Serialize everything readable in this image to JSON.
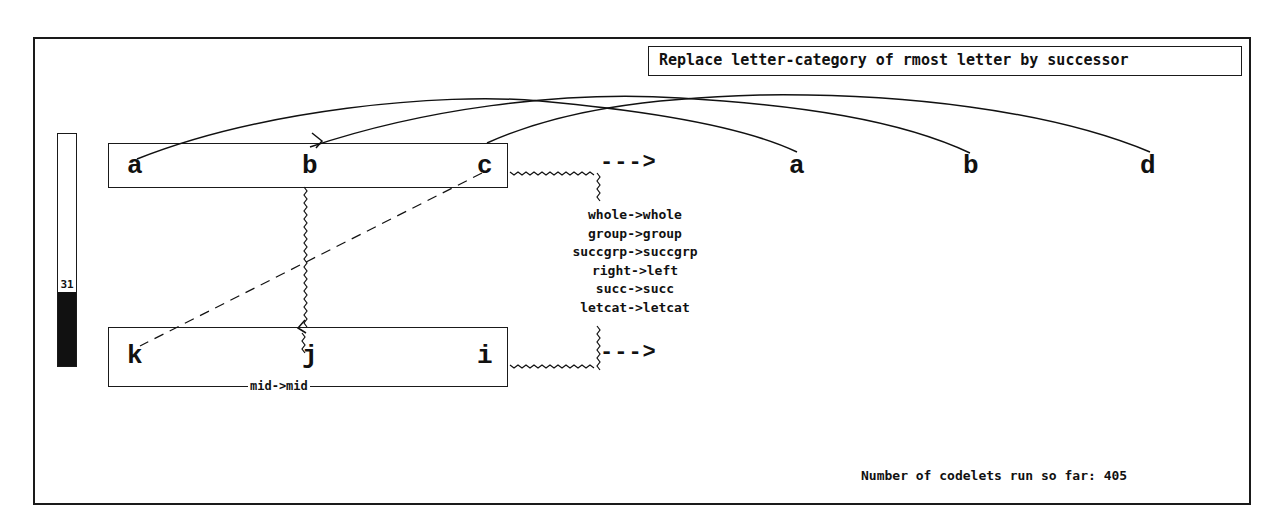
{
  "rule": {
    "text": "Replace letter-category of rmost letter by successor"
  },
  "temperature": {
    "value": "31",
    "percent": 31
  },
  "strings": {
    "initial": [
      "a",
      "b",
      "c"
    ],
    "modified": [
      "a",
      "b",
      "d"
    ],
    "target": [
      "k",
      "j",
      "i"
    ],
    "answer": []
  },
  "arrows": {
    "top": "--->",
    "bottom": "--->"
  },
  "concept_mappings": [
    "whole->whole",
    "group->group",
    "succgrp->succgrp",
    "right->left",
    "succ->succ",
    "letcat->letcat"
  ],
  "bond_mapping": {
    "label": "mid->mid"
  },
  "status": {
    "label": "Number of codelets run so far:",
    "count": "405",
    "text": "Number of codelets run so far: 405"
  },
  "colors": {
    "ink": "#111111",
    "background": "#ffffff"
  }
}
